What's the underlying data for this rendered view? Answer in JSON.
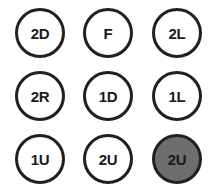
{
  "grid": {
    "rows": 3,
    "columns": 3,
    "background_color": "#ffffff",
    "ring_color": "#231f20",
    "label_color": "#1a1a1a",
    "selected_fill_color": "#6e6e6e",
    "buttons": [
      {
        "label": "2D",
        "selected": false
      },
      {
        "label": "F",
        "selected": false
      },
      {
        "label": "2L",
        "selected": false
      },
      {
        "label": "2R",
        "selected": false
      },
      {
        "label": "1D",
        "selected": false
      },
      {
        "label": "1L",
        "selected": false
      },
      {
        "label": "1U",
        "selected": false
      },
      {
        "label": "2U",
        "selected": false
      },
      {
        "label": "2U",
        "selected": true
      }
    ]
  }
}
